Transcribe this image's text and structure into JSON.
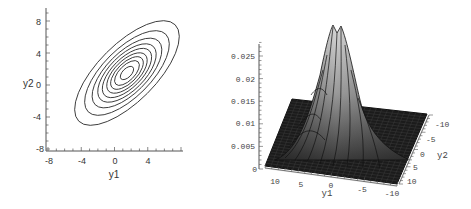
{
  "chart_data": [
    {
      "type": "contour",
      "title": "",
      "xlabel": "y1",
      "ylabel": "y2",
      "xlim": [
        -8,
        8
      ],
      "ylim": [
        -8,
        8
      ],
      "x_ticks": [
        -8,
        -4,
        0,
        4
      ],
      "y_ticks": [
        -8,
        -4,
        0,
        4,
        8
      ],
      "x_tick_labels": [
        "-8",
        "-4",
        "0",
        "4"
      ],
      "y_tick_labels": [
        "-8",
        "-4",
        "0",
        "4",
        "8"
      ],
      "grid": false,
      "levels_count": 9,
      "center": [
        1.5,
        1.5
      ],
      "orientation_deg": 45,
      "outer_contour_extent": {
        "y1": [
          -4,
          7.2
        ],
        "y2": [
          -4.5,
          8.3
        ]
      },
      "contour_semi_axes": [
        [
          1.0,
          0.55
        ],
        [
          1.9,
          0.95
        ],
        [
          2.5,
          1.25
        ],
        [
          3.1,
          1.55
        ],
        [
          3.8,
          1.85
        ],
        [
          4.5,
          2.2
        ],
        [
          5.4,
          2.55
        ],
        [
          6.6,
          3.0
        ],
        [
          8.2,
          3.6
        ]
      ]
    },
    {
      "type": "surface3d",
      "title": "",
      "xlabel": "y1",
      "ylabel": "y2",
      "zlabel": "",
      "x_ticks": [
        10,
        5,
        0,
        -5,
        -10
      ],
      "y_ticks": [
        -10,
        -5,
        0,
        5,
        10
      ],
      "z_ticks": [
        0,
        0.005,
        0.01,
        0.015,
        0.02,
        0.025
      ],
      "x_tick_labels": [
        "10",
        "5",
        "0",
        "-5",
        "-10"
      ],
      "y_tick_labels": [
        "-10",
        "-5",
        "0",
        "5",
        "10"
      ],
      "z_tick_labels": [
        "0",
        "0.005",
        "0.01",
        "0.015",
        "0.02",
        "0.025"
      ],
      "xlim": [
        -10,
        10
      ],
      "ylim": [
        -10,
        10
      ],
      "zlim": [
        0,
        0.028
      ],
      "peak_value": 0.028,
      "peak_location": {
        "y1": 1.5,
        "y2": 1.5
      },
      "grid": true,
      "shading": "grayscale"
    }
  ],
  "left": {
    "xlabel": "y1",
    "ylabel": "y2",
    "xticks": [
      "-8",
      "-4",
      "0",
      "4"
    ],
    "yticks": [
      "8",
      "4",
      "0",
      "-4",
      "-8"
    ]
  },
  "right": {
    "xlabel": "y1",
    "ylabel": "y2",
    "zticks": [
      "0.025",
      "0.02",
      "0.015",
      "0.01",
      "0.005",
      "0"
    ],
    "xticks": [
      "10",
      "5",
      "0",
      "-5",
      "-10"
    ],
    "yticks": [
      "-10",
      "-5",
      "0",
      "5",
      "10"
    ]
  },
  "colors": {
    "contour_line": "#333333",
    "axis": "#555555",
    "surface_dark": "#1a1a1a",
    "surface_light": "#cfcfcf"
  }
}
